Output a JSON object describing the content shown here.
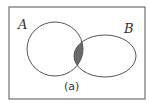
{
  "diagram": {
    "type": "venn",
    "sets": [
      {
        "label": "A"
      },
      {
        "label": "B"
      }
    ],
    "shaded_region": "A ∩ B",
    "caption": "(a)",
    "colors": {
      "stroke": "#555555",
      "shade": "#6a6a6a",
      "background": "#ffffff"
    }
  }
}
